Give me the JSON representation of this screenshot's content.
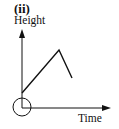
{
  "diagram": {
    "panel_label": "(ii)",
    "y_axis_label": "Height",
    "x_axis_label": "Time",
    "colors": {
      "stroke": "#111111",
      "background": "#ffffff"
    },
    "origin_marker": "circle-around-origin",
    "curve": {
      "description": "Height starts above zero at origin, rises linearly to a peak, then drops linearly",
      "points": [
        {
          "x": 22,
          "y": 93
        },
        {
          "x": 59,
          "y": 50
        },
        {
          "x": 72,
          "y": 78
        }
      ]
    }
  }
}
